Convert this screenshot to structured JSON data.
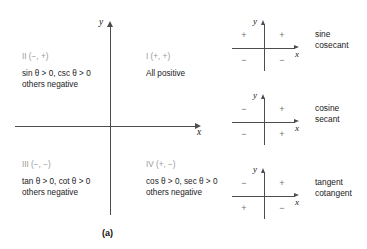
{
  "panel_a": {
    "caption": "(a)",
    "x_axis_label": "x",
    "y_axis_label": "y",
    "quadrants": [
      {
        "id": "I",
        "header": "I (+, +)",
        "lines": [
          "All positive"
        ]
      },
      {
        "id": "II",
        "header": "II (−, +)",
        "lines": [
          "sin θ > 0, csc θ > 0",
          "others negative"
        ]
      },
      {
        "id": "III",
        "header": "III (−, −)",
        "lines": [
          "tan θ > 0, cot θ > 0",
          "others negative"
        ]
      },
      {
        "id": "IV",
        "header": "IV (+, −)",
        "lines": [
          "cos θ > 0, sec θ > 0",
          "others negative"
        ]
      }
    ]
  },
  "panel_b": {
    "caption": "(b)",
    "diagrams": [
      {
        "name_line1": "sine",
        "name_line2": "cosecant",
        "x_axis_label": "x",
        "y_axis_label": "y",
        "signs": {
          "q1": "+",
          "q2": "+",
          "q3": "−",
          "q4": "−"
        }
      },
      {
        "name_line1": "cosine",
        "name_line2": "secant",
        "x_axis_label": "x",
        "y_axis_label": "y",
        "signs": {
          "q1": "+",
          "q2": "−",
          "q3": "−",
          "q4": "+"
        }
      },
      {
        "name_line1": "tangent",
        "name_line2": "cotangent",
        "x_axis_label": "x",
        "y_axis_label": "y",
        "signs": {
          "q1": "+",
          "q2": "−",
          "q3": "+",
          "q4": "−"
        }
      }
    ]
  },
  "colors": {
    "axis": "#4d4d4d",
    "quadrant_header": "#9a9a9a",
    "body_text": "#1a1a1a",
    "sign_marker": "#6f6f6f",
    "background": "#ffffff"
  }
}
